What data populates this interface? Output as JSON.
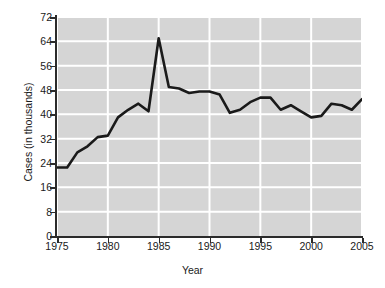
{
  "chart_data": {
    "type": "line",
    "title": "",
    "xlabel": "Year",
    "ylabel": "Cases (in thousands)",
    "xlim": [
      1975,
      2005
    ],
    "ylim": [
      0,
      72
    ],
    "xticks": [
      1975,
      1980,
      1985,
      1990,
      1995,
      2000,
      2005
    ],
    "xtick_labels": [
      "1975",
      "1980",
      "1985",
      "1990",
      "1995",
      "2000",
      "2005"
    ],
    "yticks": [
      0,
      8,
      16,
      24,
      32,
      40,
      48,
      56,
      64,
      72
    ],
    "ytick_labels": [
      "0",
      "8",
      "16",
      "24",
      "32",
      "40",
      "48",
      "56",
      "64",
      "72"
    ],
    "grid": true,
    "grid_color": "#ffffff",
    "plot_background": "#d5d5d5",
    "line_color": "#1a1a1a",
    "legend": null,
    "x": [
      1975,
      1976,
      1977,
      1978,
      1979,
      1980,
      1981,
      1982,
      1983,
      1984,
      1985,
      1986,
      1987,
      1988,
      1989,
      1990,
      1991,
      1992,
      1993,
      1994,
      1995,
      1996,
      1997,
      1998,
      1999,
      2000,
      2001,
      2002,
      2003,
      2004,
      2005
    ],
    "values": [
      22.5,
      22.5,
      27.5,
      29.5,
      32.5,
      33.0,
      39.0,
      41.5,
      43.5,
      41.0,
      65.0,
      49.0,
      48.5,
      47.0,
      47.5,
      47.5,
      46.5,
      40.5,
      41.5,
      44.0,
      45.5,
      45.5,
      41.5,
      43.0,
      41.0,
      39.0,
      39.5,
      43.5,
      43.0,
      41.5,
      45.0
    ],
    "series": [
      {
        "name": "Cases",
        "values": [
          22.5,
          22.5,
          27.5,
          29.5,
          32.5,
          33.0,
          39.0,
          41.5,
          43.5,
          41.0,
          65.0,
          49.0,
          48.5,
          47.0,
          47.5,
          47.5,
          46.5,
          40.5,
          41.5,
          44.0,
          45.5,
          45.5,
          41.5,
          43.0,
          41.0,
          39.0,
          39.5,
          43.5,
          43.0,
          41.5,
          45.0
        ]
      }
    ]
  }
}
